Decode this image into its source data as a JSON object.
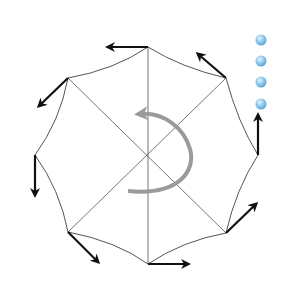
{
  "diagram": {
    "center": [
      148,
      155
    ],
    "vertices": [
      {
        "name": "top",
        "x": 148,
        "y": 47
      },
      {
        "name": "top-right",
        "x": 226,
        "y": 78
      },
      {
        "name": "right",
        "x": 258,
        "y": 155
      },
      {
        "name": "bottom-right",
        "x": 226,
        "y": 233
      },
      {
        "name": "bottom",
        "x": 148,
        "y": 264
      },
      {
        "name": "bottom-left",
        "x": 68,
        "y": 232
      },
      {
        "name": "left",
        "x": 35,
        "y": 155
      },
      {
        "name": "top-left",
        "x": 68,
        "y": 78
      }
    ],
    "force_arrows": [
      {
        "from": [
          148,
          47
        ],
        "to": [
          108,
          47
        ]
      },
      {
        "from": [
          226,
          78
        ],
        "to": [
          198,
          54
        ]
      },
      {
        "from": [
          258,
          155
        ],
        "to": [
          258,
          115
        ]
      },
      {
        "from": [
          226,
          233
        ],
        "to": [
          256,
          204
        ]
      },
      {
        "from": [
          148,
          264
        ],
        "to": [
          188,
          264
        ]
      },
      {
        "from": [
          68,
          232
        ],
        "to": [
          98,
          262
        ]
      },
      {
        "from": [
          35,
          155
        ],
        "to": [
          35,
          195
        ]
      },
      {
        "from": [
          68,
          78
        ],
        "to": [
          39,
          106
        ]
      }
    ],
    "rotation_arrow": {
      "color": "#9a9a9a",
      "direction": "counterclockwise-head-top-left"
    },
    "dots": {
      "color": "#8fc8ec",
      "count": 4,
      "x": 261,
      "ys": [
        40,
        61,
        82,
        104
      ]
    },
    "colors": {
      "edge": "#555555",
      "arrow": "#111111",
      "rotation": "#9a9a9a",
      "dot": "#8fc8ec"
    }
  }
}
